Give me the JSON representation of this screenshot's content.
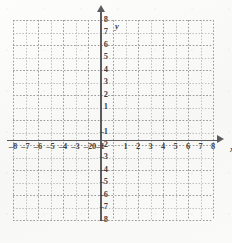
{
  "figure": {
    "kind": "cartesian-coordinate-grid",
    "title": "",
    "background_color": "#fbfbfa",
    "axis_color": "#5b5b5f",
    "gridline_color": "#b9b9b9",
    "label_color": "#3f3f43"
  },
  "chart_data": {
    "type": "scatter",
    "title": "",
    "xlabel": "x",
    "ylabel": "y",
    "xlim": [
      -8,
      8
    ],
    "ylim": [
      -8,
      8
    ],
    "grid": true,
    "legend": null,
    "series": [],
    "x": [],
    "y": [],
    "xticks": [
      -8,
      -7,
      -6,
      -5,
      -4,
      -3,
      -2,
      -1,
      1,
      2,
      3,
      4,
      5,
      6,
      7,
      8
    ],
    "yticks": [
      8,
      7,
      6,
      5,
      4,
      3,
      2,
      1,
      -1,
      -2,
      -3,
      -4,
      -5,
      -6,
      -7,
      -8
    ],
    "xtick_labels": [
      "–8",
      "–7",
      "–6",
      "–5",
      "–4",
      "–3",
      "–2",
      "–1",
      "1",
      "2",
      "3",
      "4",
      "5",
      "6",
      "7",
      "8"
    ],
    "ytick_labels": [
      "8",
      "7",
      "6",
      "5",
      "4",
      "3",
      "2",
      "1",
      "–1",
      "–2",
      "–3",
      "–4",
      "–5",
      "–6",
      "–7",
      "–8"
    ],
    "origin_label": "0",
    "x_axis_arrow": true,
    "y_axis_arrow": true
  },
  "axes": {
    "x_label": "x",
    "y_label": "y",
    "origin": "0"
  }
}
